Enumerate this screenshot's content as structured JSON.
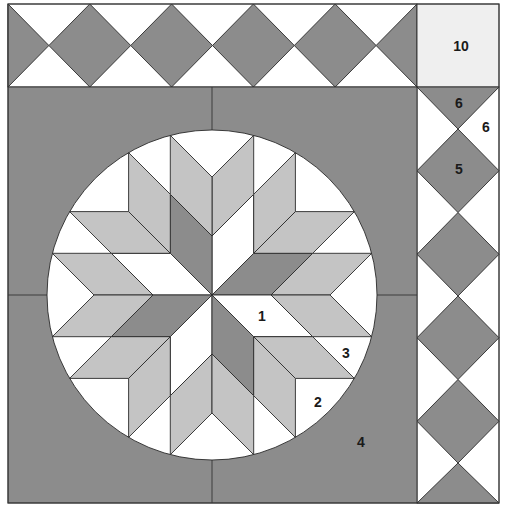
{
  "palette": {
    "dark": "#8c8c8c",
    "light": "#c4c4c4",
    "white": "#ffffff",
    "pale": "#efefef",
    "line": "#2a2a2a"
  },
  "background": {
    "fill": "#8c8c8c"
  },
  "medallion": {
    "fill": "#ffffff"
  },
  "star": {
    "sectors": [
      {
        "center": "#8c8c8c",
        "outer_a": "#c4c4c4",
        "outer_b": "#c4c4c4"
      },
      {
        "center": "#ffffff",
        "outer_a": "#c4c4c4",
        "outer_b": "#c4c4c4"
      },
      {
        "center": "#8c8c8c",
        "outer_a": "#c4c4c4",
        "outer_b": "#c4c4c4"
      },
      {
        "center": "#ffffff",
        "outer_a": "#c4c4c4",
        "outer_b": "#c4c4c4"
      },
      {
        "center": "#8c8c8c",
        "outer_a": "#c4c4c4",
        "outer_b": "#c4c4c4"
      },
      {
        "center": "#ffffff",
        "outer_a": "#c4c4c4",
        "outer_b": "#c4c4c4"
      },
      {
        "center": "#8c8c8c",
        "outer_a": "#c4c4c4",
        "outer_b": "#c4c4c4"
      },
      {
        "center": "#ffffff",
        "outer_a": "#c4c4c4",
        "outer_b": "#c4c4c4"
      }
    ]
  },
  "top_border": {
    "diamond_fill": "#8c8c8c",
    "ground_fill": "#ffffff"
  },
  "side_border": {
    "diamond_fill": "#8c8c8c",
    "ground_fill": "#ffffff",
    "corner_fill": "#efefef"
  },
  "labels": {
    "star_center_piece": "1",
    "circle_square_piece": "2",
    "circle_triangle_piece": "3",
    "background_piece": "4",
    "border_diamond_piece": "5",
    "border_dark_triangle_piece": "6",
    "border_white_triangle_piece": "6",
    "corner_square_piece": "10"
  }
}
